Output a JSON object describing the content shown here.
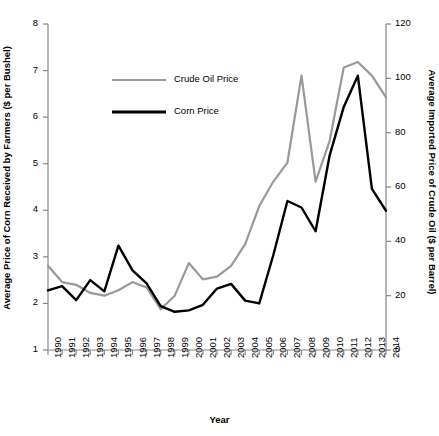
{
  "chart_data": {
    "type": "line",
    "title": "",
    "xlabel": "Year",
    "ylabel_left": "Average Price of Corn Received by Farmers ($ per Bushel)",
    "ylabel_right": "Average Imported Price of Crude Oil ($ per Barrel)",
    "x": [
      1990,
      1991,
      1992,
      1993,
      1994,
      1995,
      1996,
      1997,
      1998,
      1999,
      2000,
      2001,
      2002,
      2003,
      2004,
      2005,
      2006,
      2007,
      2008,
      2009,
      2010,
      2011,
      2012,
      2013,
      2014
    ],
    "categories": [
      "1990",
      "1991",
      "1992",
      "1993",
      "1994",
      "1995",
      "1996",
      "1997",
      "1998",
      "1999",
      "2000",
      "2001",
      "2002",
      "2003",
      "2004",
      "2005",
      "2006",
      "2007",
      "2008",
      "2009",
      "2010",
      "2011",
      "2012",
      "2013",
      "2014"
    ],
    "series": [
      {
        "name": "Crude Oil Price",
        "axis": "right",
        "color": "#999999",
        "values": [
          31,
          25,
          24,
          21,
          20,
          22,
          25,
          23,
          15,
          20,
          32,
          26,
          27,
          31,
          39,
          53,
          62,
          69,
          101,
          62,
          77,
          104,
          106,
          101,
          93
        ]
      },
      {
        "name": "Corn Price",
        "axis": "left",
        "color": "#000000",
        "values": [
          2.28,
          2.37,
          2.07,
          2.5,
          2.26,
          3.24,
          2.71,
          2.43,
          1.94,
          1.82,
          1.85,
          1.97,
          2.32,
          2.42,
          2.06,
          2.0,
          3.04,
          4.2,
          4.06,
          3.55,
          5.18,
          6.22,
          6.89,
          4.46,
          3.99
        ]
      }
    ],
    "ylim_left": [
      1,
      8
    ],
    "ylim_right": [
      0,
      120
    ],
    "yticks_left": [
      "1",
      "2",
      "3",
      "4",
      "5",
      "6",
      "7",
      "8"
    ],
    "yticks_right": [
      "0",
      "20",
      "40",
      "60",
      "80",
      "100",
      "120"
    ],
    "grid": false,
    "legend_position": "top-center",
    "legend": [
      {
        "label": "Crude Oil Price",
        "color": "#999999"
      },
      {
        "label": "Corn Price",
        "color": "#000000"
      }
    ]
  }
}
